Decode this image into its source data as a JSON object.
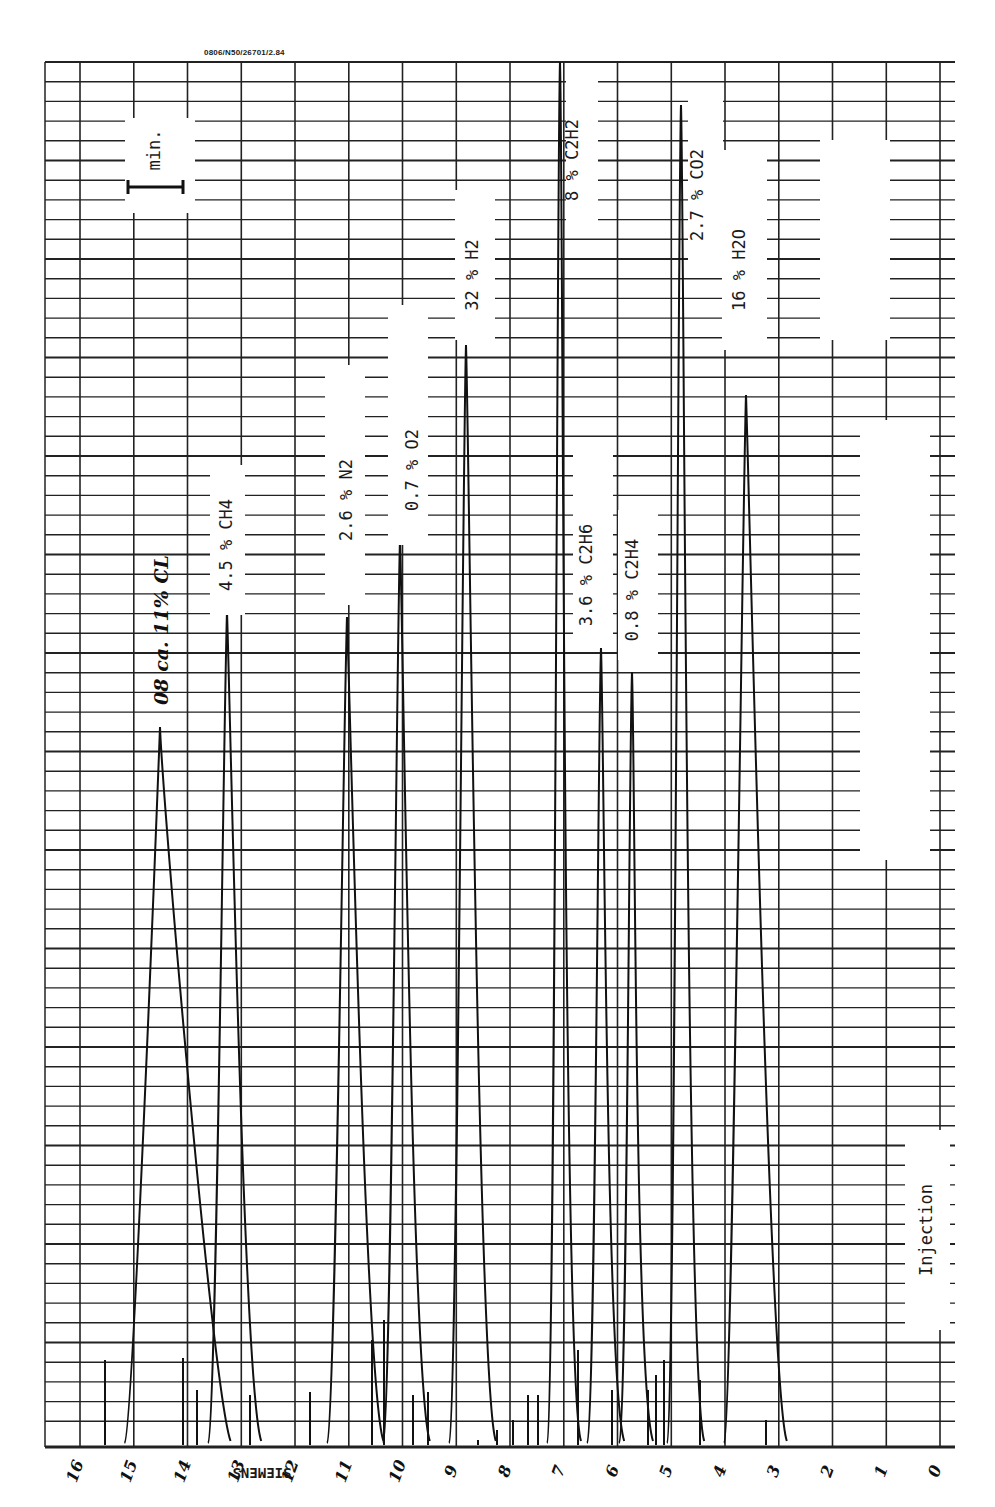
{
  "header": {
    "code": "0806/N50/26701/2.84"
  },
  "scale_marker": {
    "label": "min."
  },
  "paper_brand": "SIEMENS",
  "annotations": {
    "injection": "Injection",
    "handwritten_first_peak": "08 ca. 11% CL"
  },
  "chart_data": {
    "type": "line",
    "xlabel": "Retention time (min)",
    "ylabel": "Detector signal",
    "x_direction": "right-to-left (0 at right edge, injection near 3 min)",
    "x_ticks": [
      "16",
      "15",
      "14",
      "13",
      "12",
      "11",
      "10",
      "9",
      "8",
      "7",
      "6",
      "5",
      "4",
      "3",
      "2",
      "1",
      "0"
    ],
    "xlim": [
      0,
      16
    ],
    "grid": true,
    "peaks": [
      {
        "component": "CL (handwritten)",
        "label": "08 ca. 11% CL",
        "concentration_pct": 11,
        "retention_min": 14.5,
        "relative_height": 0.52
      },
      {
        "component": "CH4",
        "label": "4.5 % CH4",
        "concentration_pct": 4.5,
        "retention_min": 13.8,
        "relative_height": 0.6
      },
      {
        "component": "N2",
        "label": "2.6 % N2",
        "concentration_pct": 2.6,
        "retention_min": 11.3,
        "relative_height": 0.6
      },
      {
        "component": "O2",
        "label": "0.7 % O2",
        "concentration_pct": 0.7,
        "retention_min": 10.2,
        "relative_height": 0.66
      },
      {
        "component": "H2",
        "label": "32 % H2",
        "concentration_pct": 32,
        "retention_min": 8.9,
        "relative_height": 0.79
      },
      {
        "component": "C2H2",
        "label": "8 % C2H2",
        "concentration_pct": 8,
        "retention_min": 7.0,
        "relative_height": 1.0
      },
      {
        "component": "C2H6",
        "label": "3.6 % C2H6",
        "concentration_pct": 3.6,
        "retention_min": 6.4,
        "relative_height": 0.58
      },
      {
        "component": "C2H4",
        "label": "0.8 % C2H4",
        "concentration_pct": 0.8,
        "retention_min": 5.8,
        "relative_height": 0.56
      },
      {
        "component": "CO2",
        "label": "2.7 % CO2",
        "concentration_pct": 2.7,
        "retention_min": 4.8,
        "relative_height": 0.98
      },
      {
        "component": "H2O",
        "label": "16 % H2O",
        "concentration_pct": 16,
        "retention_min": 3.9,
        "relative_height": 0.75
      }
    ]
  }
}
